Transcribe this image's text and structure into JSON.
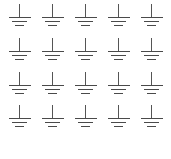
{
  "canvas": {
    "width_px": 171,
    "height_px": 159,
    "background_color": "#ffffff"
  },
  "grid": {
    "rows": 4,
    "columns": 5,
    "total_symbols": 20
  },
  "symbol": {
    "name": "earth-ground-symbol",
    "description": "Electrical earth / ground schematic symbol",
    "stroke_color": "#4a4a4a",
    "stem_color": "#555555",
    "parts": [
      "vertical-stem",
      "long-horizontal-bar",
      "medium-horizontal-bar",
      "short-horizontal-bar"
    ]
  },
  "symbols": [
    {
      "id": "ground-symbol-r1c1",
      "row": 1,
      "col": 1
    },
    {
      "id": "ground-symbol-r1c2",
      "row": 1,
      "col": 2
    },
    {
      "id": "ground-symbol-r1c3",
      "row": 1,
      "col": 3
    },
    {
      "id": "ground-symbol-r1c4",
      "row": 1,
      "col": 4
    },
    {
      "id": "ground-symbol-r1c5",
      "row": 1,
      "col": 5
    },
    {
      "id": "ground-symbol-r2c1",
      "row": 2,
      "col": 1
    },
    {
      "id": "ground-symbol-r2c2",
      "row": 2,
      "col": 2
    },
    {
      "id": "ground-symbol-r2c3",
      "row": 2,
      "col": 3
    },
    {
      "id": "ground-symbol-r2c4",
      "row": 2,
      "col": 4
    },
    {
      "id": "ground-symbol-r2c5",
      "row": 2,
      "col": 5
    },
    {
      "id": "ground-symbol-r3c1",
      "row": 3,
      "col": 1
    },
    {
      "id": "ground-symbol-r3c2",
      "row": 3,
      "col": 2
    },
    {
      "id": "ground-symbol-r3c3",
      "row": 3,
      "col": 3
    },
    {
      "id": "ground-symbol-r3c4",
      "row": 3,
      "col": 4
    },
    {
      "id": "ground-symbol-r3c5",
      "row": 3,
      "col": 5
    },
    {
      "id": "ground-symbol-r4c1",
      "row": 4,
      "col": 1
    },
    {
      "id": "ground-symbol-r4c2",
      "row": 4,
      "col": 2
    },
    {
      "id": "ground-symbol-r4c3",
      "row": 4,
      "col": 3
    },
    {
      "id": "ground-symbol-r4c4",
      "row": 4,
      "col": 4
    },
    {
      "id": "ground-symbol-r4c5",
      "row": 4,
      "col": 5
    }
  ]
}
